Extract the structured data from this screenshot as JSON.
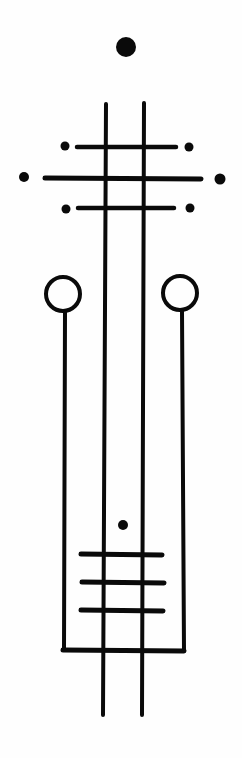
{
  "canvas": {
    "width": 242,
    "height": 758,
    "background": "#fefefe",
    "ink": "#0a0a0a"
  },
  "diagram": {
    "type": "hand-drawn-symbol",
    "top_dot": {
      "cx": 126,
      "cy": 47,
      "r": 10
    },
    "main_verticals": [
      {
        "x1": 106,
        "y1": 104,
        "x2": 103,
        "y2": 715
      },
      {
        "x1": 144,
        "y1": 103,
        "x2": 142,
        "y2": 715
      }
    ],
    "upper_crossbars": [
      {
        "x1": 77,
        "y1": 147,
        "x2": 176,
        "y2": 147,
        "dots": [
          {
            "cx": 65,
            "cy": 146,
            "r": 4.5
          },
          {
            "cx": 189,
            "cy": 147,
            "r": 4.5
          }
        ]
      },
      {
        "x1": 45,
        "y1": 178,
        "x2": 201,
        "y2": 179,
        "dots": [
          {
            "cx": 24,
            "cy": 177,
            "r": 5
          },
          {
            "cx": 220,
            "cy": 179,
            "r": 5.5
          }
        ]
      },
      {
        "x1": 78,
        "y1": 208,
        "x2": 174,
        "y2": 208,
        "dots": [
          {
            "cx": 66,
            "cy": 209,
            "r": 4.5
          },
          {
            "cx": 190,
            "cy": 208,
            "r": 4.5
          }
        ]
      }
    ],
    "side_circles": [
      {
        "cx": 63,
        "cy": 294,
        "r": 17,
        "stem": {
          "x1": 65,
          "y1": 312,
          "x2": 64,
          "y2": 650
        }
      },
      {
        "cx": 180,
        "cy": 293,
        "r": 17,
        "stem": {
          "x1": 182,
          "y1": 311,
          "x2": 184,
          "y2": 650
        }
      }
    ],
    "bottom_bar": {
      "x1": 63,
      "y1": 650,
      "x2": 184,
      "y2": 651
    },
    "inner_dot": {
      "cx": 123,
      "cy": 525,
      "r": 5
    },
    "lower_crossbars": [
      {
        "x1": 81,
        "y1": 554,
        "x2": 162,
        "y2": 555
      },
      {
        "x1": 82,
        "y1": 582,
        "x2": 164,
        "y2": 583
      },
      {
        "x1": 81,
        "y1": 610,
        "x2": 163,
        "y2": 611
      }
    ]
  }
}
